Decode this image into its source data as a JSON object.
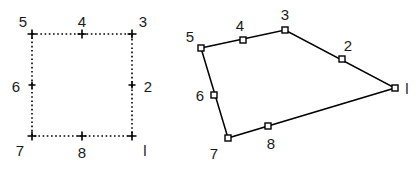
{
  "figure": {
    "background_color": "#ffffff",
    "stroke_color": "#000000",
    "label_color": "#1a1a1a",
    "width": 418,
    "height": 170,
    "panels": [
      {
        "id": "left-panel",
        "name": "square-dotted-outline",
        "line_style": "dotted",
        "marker_style": "plus-cross",
        "vertices": [
          {
            "label": "5",
            "role": "corner",
            "point_x": 32,
            "point_y": 34,
            "label_x": 23,
            "label_y": 21
          },
          {
            "label": "4",
            "role": "midpoint",
            "point_x": 82,
            "point_y": 34,
            "label_x": 82,
            "label_y": 21
          },
          {
            "label": "3",
            "role": "corner",
            "point_x": 132,
            "point_y": 34,
            "label_x": 143,
            "label_y": 21
          },
          {
            "label": "2",
            "role": "midpoint",
            "point_x": 132,
            "point_y": 85,
            "label_x": 148,
            "label_y": 86
          },
          {
            "label": "l",
            "role": "corner",
            "point_x": 132,
            "point_y": 136,
            "label_x": 145,
            "label_y": 150
          },
          {
            "label": "8",
            "role": "midpoint",
            "point_x": 82,
            "point_y": 136,
            "label_x": 82,
            "label_y": 152
          },
          {
            "label": "7",
            "role": "corner",
            "point_x": 32,
            "point_y": 136,
            "label_x": 20,
            "label_y": 150
          },
          {
            "label": "6",
            "role": "midpoint",
            "point_x": 32,
            "point_y": 85,
            "label_x": 16,
            "label_y": 86
          }
        ],
        "polygon_path": "32,34 132,34 132,136 32,136"
      },
      {
        "id": "right-panel",
        "name": "quadrilateral-solid-outline",
        "line_style": "solid",
        "marker_style": "open-square",
        "vertices": [
          {
            "label": "5",
            "role": "corner",
            "point_x": 201,
            "point_y": 48,
            "label_x": 190,
            "label_y": 36
          },
          {
            "label": "4",
            "role": "midpoint",
            "point_x": 243,
            "point_y": 40,
            "label_x": 240,
            "label_y": 25
          },
          {
            "label": "3",
            "role": "corner",
            "point_x": 285,
            "point_y": 30,
            "label_x": 285,
            "label_y": 14
          },
          {
            "label": "2",
            "role": "midpoint",
            "point_x": 342,
            "point_y": 59,
            "label_x": 348,
            "label_y": 45
          },
          {
            "label": "l",
            "role": "corner",
            "point_x": 395,
            "point_y": 88,
            "label_x": 407,
            "label_y": 88
          },
          {
            "label": "8",
            "role": "midpoint",
            "point_x": 268,
            "point_y": 126,
            "label_x": 271,
            "label_y": 143
          },
          {
            "label": "7",
            "role": "corner",
            "point_x": 228,
            "point_y": 138,
            "label_x": 214,
            "label_y": 153
          },
          {
            "label": "6",
            "role": "midpoint",
            "point_x": 214,
            "point_y": 95,
            "label_x": 200,
            "label_y": 95
          }
        ],
        "polygon_path": "201,48 285,30 395,88 228,138"
      }
    ]
  },
  "chart_data": {
    "type": "scatter",
    "xlabel": "",
    "ylabel": "",
    "legend": [],
    "grid": false,
    "series": [
      {
        "name": "left-square-dotted",
        "labels": [
          "5",
          "4",
          "3",
          "2",
          "l",
          "8",
          "7",
          "6"
        ],
        "x": [
          32,
          82,
          132,
          132,
          132,
          82,
          32,
          32
        ],
        "y": [
          34,
          34,
          34,
          85,
          136,
          136,
          136,
          85
        ]
      },
      {
        "name": "right-quadrilateral-solid",
        "labels": [
          "5",
          "4",
          "3",
          "2",
          "l",
          "8",
          "7",
          "6"
        ],
        "x": [
          201,
          243,
          285,
          342,
          395,
          268,
          228,
          214
        ],
        "y": [
          48,
          40,
          30,
          59,
          88,
          126,
          138,
          95
        ]
      }
    ]
  }
}
